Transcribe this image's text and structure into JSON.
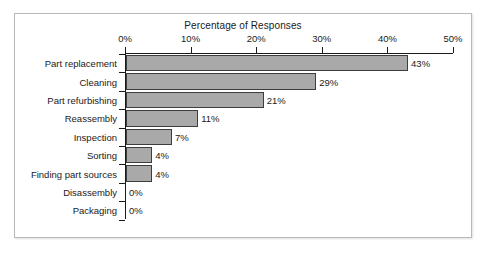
{
  "chart_data": {
    "type": "bar",
    "orientation": "horizontal",
    "title": "Percentage of Responses",
    "xlabel": "",
    "ylabel": "",
    "xlim": [
      0,
      50
    ],
    "grid": false,
    "legend": null,
    "bar_color": "#a9a9a9",
    "bar_edge_color": "#3d3d3d",
    "axis_color": "#1a1a1a",
    "xticks": [
      "0%",
      "10%",
      "20%",
      "30%",
      "40%",
      "50%"
    ],
    "xtick_values": [
      0,
      10,
      20,
      30,
      40,
      50
    ],
    "categories": [
      "Part replacement",
      "Cleaning",
      "Part refurbishing",
      "Reassembly",
      "Inspection",
      "Sorting",
      "Finding part sources",
      "Disassembly",
      "Packaging"
    ],
    "values": [
      43,
      29,
      21,
      11,
      7,
      4,
      4,
      0,
      0
    ],
    "data_labels": [
      "43%",
      "29%",
      "21%",
      "11%",
      "7%",
      "4%",
      "4%",
      "0%",
      "0%"
    ]
  }
}
